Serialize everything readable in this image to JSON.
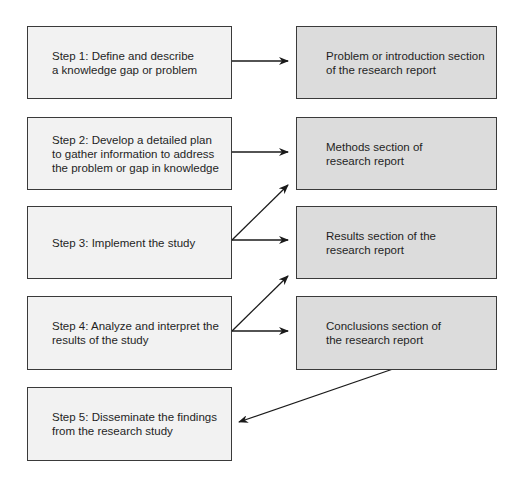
{
  "steps": [
    {
      "id": "step-1",
      "label": "Step 1: Define and describe\na knowledge gap or problem"
    },
    {
      "id": "step-2",
      "label": "Step 2: Develop a detailed plan\nto gather information to address\nthe problem or gap in knowledge"
    },
    {
      "id": "step-3",
      "label": "Step 3: Implement the study"
    },
    {
      "id": "step-4",
      "label": "Step 4: Analyze and interpret the\nresults of the study"
    },
    {
      "id": "step-5",
      "label": "Step 5: Disseminate the findings\nfrom the research study"
    }
  ],
  "sections": [
    {
      "id": "introduction",
      "label": "Problem or introduction section\nof the research report"
    },
    {
      "id": "methods",
      "label": "Methods section of\nresearch report"
    },
    {
      "id": "results",
      "label": "Results section of the\nresearch report"
    },
    {
      "id": "conclusions",
      "label": "Conclusions section of\nthe research report"
    }
  ],
  "connections": [
    {
      "from": "step-1",
      "to": "introduction"
    },
    {
      "from": "step-2",
      "to": "methods"
    },
    {
      "from": "step-3",
      "to": "methods"
    },
    {
      "from": "step-3",
      "to": "results"
    },
    {
      "from": "step-4",
      "to": "results"
    },
    {
      "from": "step-4",
      "to": "conclusions"
    },
    {
      "from": "conclusions",
      "to": "step-5"
    }
  ],
  "colors": {
    "step_fill": "#f2f2f2",
    "section_fill": "#dcdcdc",
    "border": "#3a3a3a",
    "arrow": "#1a1a1a"
  }
}
